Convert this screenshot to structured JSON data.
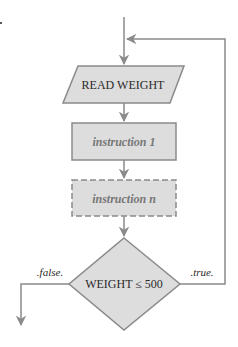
{
  "diagram": {
    "type": "flowchart",
    "colors": {
      "line": "#8a8a8a",
      "fill": "#dddddd",
      "text_dark": "#2a2a2a",
      "text_muted": "#777777"
    },
    "nodes": {
      "read": {
        "shape": "parallelogram",
        "label": "READ WEIGHT"
      },
      "instr1": {
        "shape": "rectangle",
        "label": "instruction 1"
      },
      "instrn": {
        "shape": "rectangle-dashed",
        "label": "instruction n"
      },
      "decision": {
        "shape": "diamond",
        "label": "WEIGHT ≤ 500"
      }
    },
    "edges": {
      "true_label": ".true.",
      "false_label": ".false."
    },
    "margin_mark": "."
  }
}
